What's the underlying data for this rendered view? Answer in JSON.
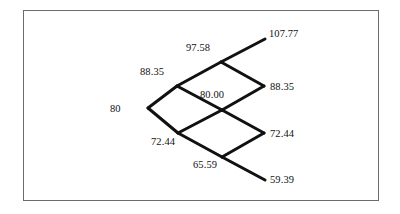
{
  "figure": {
    "kind": "binomial-lattice-diagram",
    "border_color": "#6b6b6b",
    "line_color": "#111111",
    "background": "#ffffff"
  },
  "chart_data": {
    "type": "diagram",
    "subtype": "binomial-tree",
    "title": "",
    "xlabel": "",
    "ylabel": "",
    "steps": 3,
    "initial_value": 80,
    "up_factor": 1.1044,
    "down_factor": 0.9055,
    "nodes": [
      {
        "id": "n0",
        "label": "80",
        "value": 80,
        "step": 0,
        "level": 0,
        "x": 148,
        "y": 108,
        "label_x": 110,
        "label_y": 104,
        "anchor": "left"
      },
      {
        "id": "n1u",
        "label": "88.35",
        "value": 88.35,
        "step": 1,
        "level": 1,
        "x": 177,
        "y": 86,
        "label_x": 140,
        "label_y": 67,
        "anchor": "left"
      },
      {
        "id": "n1d",
        "label": "72.44",
        "value": 72.44,
        "step": 1,
        "level": -1,
        "x": 178,
        "y": 133,
        "label_x": 151,
        "label_y": 137,
        "anchor": "left"
      },
      {
        "id": "n2uu",
        "label": "97.58",
        "value": 97.58,
        "step": 2,
        "level": 2,
        "x": 221,
        "y": 62,
        "label_x": 186,
        "label_y": 43,
        "anchor": "left"
      },
      {
        "id": "n2ud",
        "label": "80.00",
        "value": 80.0,
        "step": 2,
        "level": 0,
        "x": 222,
        "y": 110,
        "label_x": 200,
        "label_y": 90,
        "anchor": "left"
      },
      {
        "id": "n2dd",
        "label": "65.59",
        "value": 65.59,
        "step": 2,
        "level": -2,
        "x": 222,
        "y": 157,
        "label_x": 193,
        "label_y": 160,
        "anchor": "left"
      },
      {
        "id": "n3uuu",
        "label": "107.77",
        "value": 107.77,
        "step": 3,
        "level": 3,
        "x": 265,
        "y": 39,
        "label_x": 269,
        "label_y": 29,
        "anchor": "left"
      },
      {
        "id": "n3uud",
        "label": "88.35",
        "value": 88.35,
        "step": 3,
        "level": 1,
        "x": 264,
        "y": 86,
        "label_x": 270,
        "label_y": 82,
        "anchor": "left"
      },
      {
        "id": "n3udd",
        "label": "72.44",
        "value": 72.44,
        "step": 3,
        "level": -1,
        "x": 264,
        "y": 133,
        "label_x": 270,
        "label_y": 129,
        "anchor": "left"
      },
      {
        "id": "n3ddd",
        "label": "59.39",
        "value": 59.39,
        "step": 3,
        "level": -3,
        "x": 265,
        "y": 180,
        "label_x": 270,
        "label_y": 175,
        "anchor": "left"
      }
    ],
    "edges": [
      {
        "from": "n0",
        "to": "n1u",
        "direction": "up"
      },
      {
        "from": "n0",
        "to": "n1d",
        "direction": "down"
      },
      {
        "from": "n1u",
        "to": "n2uu",
        "direction": "up"
      },
      {
        "from": "n1u",
        "to": "n2ud",
        "direction": "down"
      },
      {
        "from": "n1d",
        "to": "n2ud",
        "direction": "up"
      },
      {
        "from": "n1d",
        "to": "n2dd",
        "direction": "down"
      },
      {
        "from": "n2uu",
        "to": "n3uuu",
        "direction": "up"
      },
      {
        "from": "n2uu",
        "to": "n3uud",
        "direction": "down"
      },
      {
        "from": "n2ud",
        "to": "n3uud",
        "direction": "up"
      },
      {
        "from": "n2ud",
        "to": "n3udd",
        "direction": "down"
      },
      {
        "from": "n2dd",
        "to": "n3udd",
        "direction": "up"
      },
      {
        "from": "n2dd",
        "to": "n3ddd",
        "direction": "down"
      }
    ]
  }
}
